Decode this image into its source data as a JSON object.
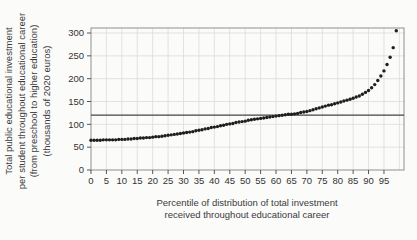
{
  "page": {
    "background": "#fbfbfa"
  },
  "chart_data": {
    "type": "scatter",
    "title": "",
    "x_axis": {
      "label_lines": [
        "Percentile of distribution of total investment",
        "received throughout educational career"
      ],
      "ticks": [
        0,
        5,
        10,
        15,
        20,
        25,
        30,
        35,
        40,
        45,
        50,
        55,
        60,
        65,
        70,
        75,
        80,
        85,
        90,
        95
      ],
      "lim": [
        0,
        101.5
      ]
    },
    "y_axis": {
      "label_lines": [
        "Total public educational investment",
        "per student throughout educational career",
        "(from preschool to higher education)",
        "(thousands of 2020 euros)"
      ],
      "ticks": [
        0,
        50,
        100,
        150,
        200,
        250,
        300
      ],
      "lim": [
        0,
        311
      ]
    },
    "reference_line": {
      "value": 120,
      "color": "#454545"
    },
    "grid": true,
    "legend": "none",
    "series": [
      {
        "name": "total-public-investment-by-percentile",
        "marker": "circle",
        "color": "#1e1e1e",
        "x_start": 0,
        "x_step": 1,
        "values": [
          65,
          65,
          65,
          65,
          66,
          66,
          66,
          66,
          66,
          67,
          67,
          67,
          68,
          68,
          69,
          69,
          70,
          70,
          71,
          71,
          72,
          73,
          73,
          74,
          75,
          76,
          77,
          78,
          79,
          80,
          81,
          82,
          83,
          84,
          86,
          87,
          88,
          90,
          91,
          93,
          94,
          95,
          97,
          98,
          100,
          101,
          102,
          104,
          105,
          106,
          107,
          109,
          110,
          111,
          112,
          113,
          114,
          115,
          116,
          117,
          118,
          119,
          120,
          121,
          122,
          122,
          123,
          124,
          126,
          127,
          128,
          130,
          132,
          134,
          136,
          138,
          140,
          142,
          143,
          145,
          147,
          149,
          151,
          153,
          155,
          157,
          160,
          162,
          166,
          170,
          174,
          180,
          187,
          196,
          206,
          217,
          231,
          247,
          268,
          305
        ]
      }
    ],
    "colors": {
      "grid": "#dcdcdc",
      "frame": "#8f8f8f",
      "tick": "#555555",
      "label": "#333333"
    }
  }
}
